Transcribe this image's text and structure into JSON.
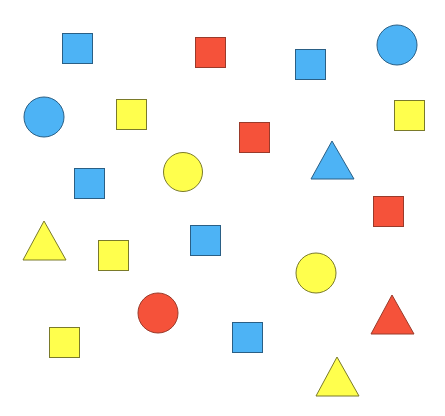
{
  "canvas": {
    "width": 445,
    "height": 416,
    "background": "#ffffff"
  },
  "colors": {
    "blue": {
      "fill": "#4db3f5",
      "stroke": "#2a5f85"
    },
    "red": {
      "fill": "#f5523a",
      "stroke": "#9a3a2a"
    },
    "yellow": {
      "fill": "#ffff4d",
      "stroke": "#7a7a2a"
    }
  },
  "shapes": [
    {
      "type": "square",
      "color": "blue",
      "x": 62,
      "y": 33,
      "size": 31
    },
    {
      "type": "square",
      "color": "red",
      "x": 195,
      "y": 37,
      "size": 31
    },
    {
      "type": "square",
      "color": "blue",
      "x": 295,
      "y": 49,
      "size": 31
    },
    {
      "type": "circle",
      "color": "blue",
      "cx": 397,
      "cy": 45,
      "r": 20
    },
    {
      "type": "circle",
      "color": "blue",
      "cx": 44,
      "cy": 117,
      "r": 20
    },
    {
      "type": "square",
      "color": "yellow",
      "x": 116,
      "y": 99,
      "size": 31
    },
    {
      "type": "square",
      "color": "yellow",
      "x": 394,
      "y": 100,
      "size": 31
    },
    {
      "type": "square",
      "color": "red",
      "x": 239,
      "y": 122,
      "size": 31
    },
    {
      "type": "square",
      "color": "blue",
      "x": 74,
      "y": 168,
      "size": 31
    },
    {
      "type": "circle",
      "color": "yellow",
      "cx": 183,
      "cy": 172,
      "r": 19.5
    },
    {
      "type": "triangle",
      "color": "blue",
      "apex": [
        332,
        141
      ],
      "base_y": 179,
      "base_x1": 311,
      "base_x2": 354
    },
    {
      "type": "square",
      "color": "red",
      "x": 373,
      "y": 196,
      "size": 31
    },
    {
      "type": "triangle",
      "color": "yellow",
      "apex": [
        44,
        221
      ],
      "base_y": 260,
      "base_x1": 23,
      "base_x2": 66
    },
    {
      "type": "square",
      "color": "yellow",
      "x": 98,
      "y": 240,
      "size": 31
    },
    {
      "type": "square",
      "color": "blue",
      "x": 190,
      "y": 225,
      "size": 31
    },
    {
      "type": "circle",
      "color": "yellow",
      "cx": 316,
      "cy": 273,
      "r": 20
    },
    {
      "type": "circle",
      "color": "red",
      "cx": 158,
      "cy": 313,
      "r": 20
    },
    {
      "type": "triangle",
      "color": "red",
      "apex": [
        392,
        295
      ],
      "base_y": 334,
      "base_x1": 371,
      "base_x2": 414
    },
    {
      "type": "square",
      "color": "yellow",
      "x": 49,
      "y": 327,
      "size": 31
    },
    {
      "type": "square",
      "color": "blue",
      "x": 232,
      "y": 322,
      "size": 31
    },
    {
      "type": "triangle",
      "color": "yellow",
      "apex": [
        337,
        357
      ],
      "base_y": 396,
      "base_x1": 316,
      "base_x2": 359
    }
  ]
}
